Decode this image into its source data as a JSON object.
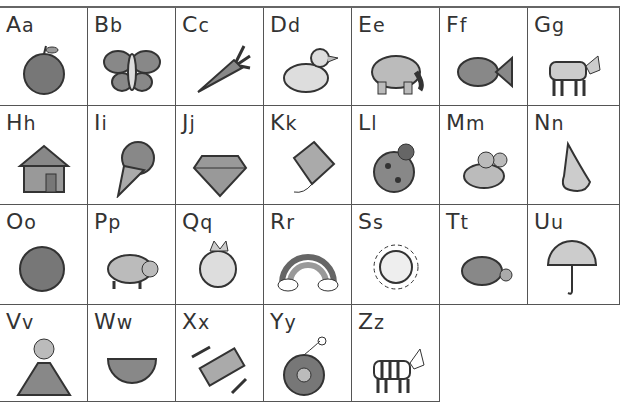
{
  "cells": [
    {
      "upper": "A",
      "lower": "a",
      "icon": "apple"
    },
    {
      "upper": "B",
      "lower": "b",
      "icon": "butterfly"
    },
    {
      "upper": "C",
      "lower": "c",
      "icon": "carrot"
    },
    {
      "upper": "D",
      "lower": "d",
      "icon": "duck"
    },
    {
      "upper": "E",
      "lower": "e",
      "icon": "elephant"
    },
    {
      "upper": "F",
      "lower": "f",
      "icon": "fish"
    },
    {
      "upper": "G",
      "lower": "g",
      "icon": "goat"
    },
    {
      "upper": "H",
      "lower": "h",
      "icon": "house"
    },
    {
      "upper": "I",
      "lower": "i",
      "icon": "ice-cream"
    },
    {
      "upper": "J",
      "lower": "j",
      "icon": "jewel"
    },
    {
      "upper": "K",
      "lower": "k",
      "icon": "kite"
    },
    {
      "upper": "L",
      "lower": "l",
      "icon": "ladybug"
    },
    {
      "upper": "M",
      "lower": "m",
      "icon": "mouse"
    },
    {
      "upper": "N",
      "lower": "n",
      "icon": "nose"
    },
    {
      "upper": "O",
      "lower": "o",
      "icon": "orange"
    },
    {
      "upper": "P",
      "lower": "p",
      "icon": "pig"
    },
    {
      "upper": "Q",
      "lower": "q",
      "icon": "queen"
    },
    {
      "upper": "R",
      "lower": "r",
      "icon": "rainbow"
    },
    {
      "upper": "S",
      "lower": "s",
      "icon": "sun"
    },
    {
      "upper": "T",
      "lower": "t",
      "icon": "turtle"
    },
    {
      "upper": "U",
      "lower": "u",
      "icon": "umbrella"
    },
    {
      "upper": "V",
      "lower": "v",
      "icon": "volcano"
    },
    {
      "upper": "W",
      "lower": "w",
      "icon": "watermelon"
    },
    {
      "upper": "X",
      "lower": "x",
      "icon": "xylophone"
    },
    {
      "upper": "Y",
      "lower": "y",
      "icon": "yo-yo"
    },
    {
      "upper": "Z",
      "lower": "z",
      "icon": "zebra"
    }
  ]
}
